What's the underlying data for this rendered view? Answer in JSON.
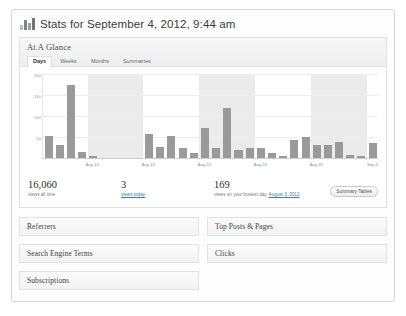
{
  "window": {
    "title": "Stats for September 4, 2012, 9:44 am",
    "icon": "bar-chart-icon"
  },
  "glance": {
    "title": "At A Glance",
    "tabs": [
      {
        "label": "Days",
        "active": true
      },
      {
        "label": "Weeks",
        "active": false
      },
      {
        "label": "Months",
        "active": false
      },
      {
        "label": "Summaries",
        "active": false
      }
    ]
  },
  "summary": {
    "all_time": {
      "value": "16,060",
      "label": "views all time"
    },
    "today": {
      "value": "3",
      "label": "views today",
      "label_is_link": true
    },
    "busiest": {
      "value": "169",
      "label_prefix": "views on your busiest day, ",
      "label_link": "August 3, 2012"
    },
    "button": "Summary Tables"
  },
  "panels": {
    "left": [
      "Referrers",
      "Search Engine Terms",
      "Subscriptions"
    ],
    "right": [
      "Top Posts & Pages",
      "Clicks"
    ]
  },
  "chart_data": {
    "type": "bar",
    "title": "",
    "xlabel": "",
    "ylabel": "",
    "ylim": [
      0,
      200
    ],
    "grid": true,
    "legend": false,
    "yticks": [
      200,
      150,
      100,
      50
    ],
    "bar_color": "#9a9a9a",
    "band_color": "#ebebeb",
    "tick_positions": [
      4,
      9,
      14,
      19,
      24,
      29
    ],
    "categories": [
      "Aug 6",
      "Aug 7",
      "Aug 8",
      "Aug 9",
      "Aug 10",
      "Aug 11",
      "Aug 12",
      "Aug 13",
      "Aug 14",
      "Aug 15",
      "Aug 16",
      "Aug 17",
      "Aug 18",
      "Aug 19",
      "Aug 20",
      "Aug 21",
      "Aug 22",
      "Aug 23",
      "Aug 24",
      "Aug 25",
      "Aug 26",
      "Aug 27",
      "Aug 28",
      "Aug 29",
      "Aug 30",
      "Aug 31",
      "Sep 1",
      "Sep 2",
      "Sep 3",
      "Sep 4"
    ],
    "tick_labels": [
      "Aug 10",
      "Aug 15",
      "Aug 20",
      "Aug 25",
      "Aug 30",
      "Sep 4"
    ],
    "values": [
      52,
      30,
      172,
      14,
      4,
      0,
      0,
      0,
      0,
      55,
      24,
      52,
      22,
      10,
      70,
      22,
      118,
      18,
      22,
      22,
      10,
      4,
      42,
      48,
      30,
      30,
      38,
      6,
      4,
      34
    ],
    "shaded_bands": [
      [
        4,
        9
      ],
      [
        14,
        19
      ],
      [
        24,
        29
      ]
    ]
  },
  "footer": {
    "text": ""
  }
}
